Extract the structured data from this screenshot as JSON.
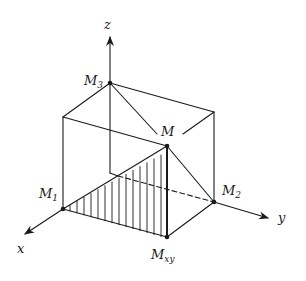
{
  "diagram": {
    "title": "",
    "colors": {
      "stroke": "#1a1a1a",
      "background": "#ffffff"
    },
    "axes": {
      "x": {
        "label": "x"
      },
      "y": {
        "label": "y"
      },
      "z": {
        "label": "z"
      }
    },
    "points": {
      "M": {
        "base": "M",
        "sub": ""
      },
      "M1": {
        "base": "M",
        "sub": "1"
      },
      "M2": {
        "base": "M",
        "sub": "2"
      },
      "M3": {
        "base": "M",
        "sub": "3"
      },
      "Mxy": {
        "base": "M",
        "sub": "xy"
      }
    },
    "shaded_region": "triangle M1-Mxy-M (vertical hatching)"
  }
}
